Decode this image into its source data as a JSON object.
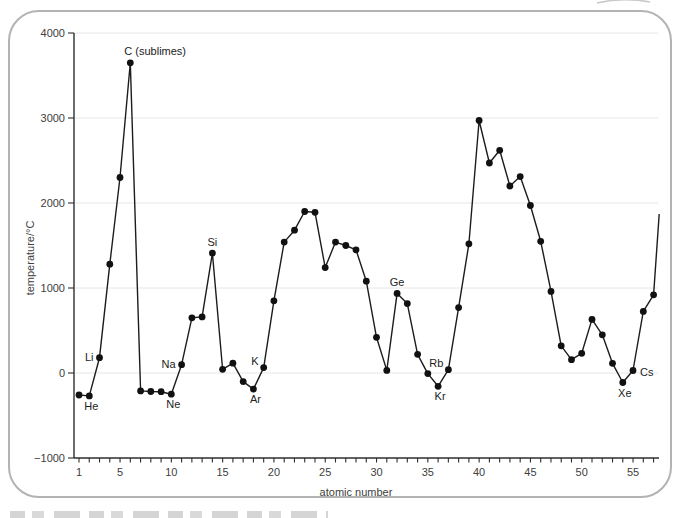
{
  "figure": {
    "panel_border_color": "#b3b3b3",
    "background_color": "#ffffff"
  },
  "chart_data": {
    "type": "line",
    "title": "",
    "xlabel": "atomic number",
    "ylabel": "temperature/°C",
    "xlim": [
      1,
      57.6
    ],
    "ylim": [
      -1000,
      4000
    ],
    "grid": "horizontal-light",
    "legend": "none",
    "marker": "filled-circle",
    "line_color": "#1c1c1c",
    "grid_color": "#e6e6e6",
    "y_ticks": [
      {
        "value": 4000,
        "label": "4000"
      },
      {
        "value": 3000,
        "label": "3000"
      },
      {
        "value": 2000,
        "label": "2000"
      },
      {
        "value": 1000,
        "label": "1000"
      },
      {
        "value": 0,
        "label": "0"
      },
      {
        "value": -1000,
        "label": "−1000"
      }
    ],
    "x_ticks_labeled": [
      1,
      5,
      10,
      15,
      20,
      25,
      30,
      35,
      40,
      45,
      50,
      55
    ],
    "x_minor_tick_step": 1,
    "x_minor_tick_range": [
      1,
      57
    ],
    "points": [
      {
        "z": 1,
        "element": "H",
        "value": -259
      },
      {
        "z": 2,
        "element": "He",
        "value": -270
      },
      {
        "z": 3,
        "element": "Li",
        "value": 180
      },
      {
        "z": 4,
        "element": "Be",
        "value": 1280
      },
      {
        "z": 5,
        "element": "B",
        "value": 2300
      },
      {
        "z": 6,
        "element": "C",
        "value": 3650
      },
      {
        "z": 7,
        "element": "N",
        "value": -210
      },
      {
        "z": 8,
        "element": "O",
        "value": -218
      },
      {
        "z": 9,
        "element": "F",
        "value": -220
      },
      {
        "z": 10,
        "element": "Ne",
        "value": -249
      },
      {
        "z": 11,
        "element": "Na",
        "value": 98
      },
      {
        "z": 12,
        "element": "Mg",
        "value": 650
      },
      {
        "z": 13,
        "element": "Al",
        "value": 660
      },
      {
        "z": 14,
        "element": "Si",
        "value": 1410
      },
      {
        "z": 15,
        "element": "P",
        "value": 44
      },
      {
        "z": 16,
        "element": "S",
        "value": 115
      },
      {
        "z": 17,
        "element": "Cl",
        "value": -101
      },
      {
        "z": 18,
        "element": "Ar",
        "value": -189
      },
      {
        "z": 19,
        "element": "K",
        "value": 63
      },
      {
        "z": 20,
        "element": "Ca",
        "value": 850
      },
      {
        "z": 21,
        "element": "Sc",
        "value": 1540
      },
      {
        "z": 22,
        "element": "Ti",
        "value": 1680
      },
      {
        "z": 23,
        "element": "V",
        "value": 1900
      },
      {
        "z": 24,
        "element": "Cr",
        "value": 1890
      },
      {
        "z": 25,
        "element": "Mn",
        "value": 1240
      },
      {
        "z": 26,
        "element": "Fe",
        "value": 1540
      },
      {
        "z": 27,
        "element": "Co",
        "value": 1500
      },
      {
        "z": 28,
        "element": "Ni",
        "value": 1450
      },
      {
        "z": 29,
        "element": "Cu",
        "value": 1080
      },
      {
        "z": 30,
        "element": "Zn",
        "value": 420
      },
      {
        "z": 31,
        "element": "Ga",
        "value": 30
      },
      {
        "z": 32,
        "element": "Ge",
        "value": 937
      },
      {
        "z": 33,
        "element": "As",
        "value": 817
      },
      {
        "z": 34,
        "element": "Se",
        "value": 220
      },
      {
        "z": 35,
        "element": "Br",
        "value": -7
      },
      {
        "z": 36,
        "element": "Kr",
        "value": -157
      },
      {
        "z": 37,
        "element": "Rb",
        "value": 39
      },
      {
        "z": 38,
        "element": "Sr",
        "value": 770
      },
      {
        "z": 39,
        "element": "Y",
        "value": 1520
      },
      {
        "z": 40,
        "element": "Zr",
        "value": 2970
      },
      {
        "z": 41,
        "element": "Nb",
        "value": 2470
      },
      {
        "z": 42,
        "element": "Mo",
        "value": 2620
      },
      {
        "z": 43,
        "element": "Tc",
        "value": 2200
      },
      {
        "z": 44,
        "element": "Ru",
        "value": 2310
      },
      {
        "z": 45,
        "element": "Rh",
        "value": 1970
      },
      {
        "z": 46,
        "element": "Pd",
        "value": 1550
      },
      {
        "z": 47,
        "element": "Ag",
        "value": 960
      },
      {
        "z": 48,
        "element": "Cd",
        "value": 320
      },
      {
        "z": 49,
        "element": "In",
        "value": 157
      },
      {
        "z": 50,
        "element": "Sn",
        "value": 232
      },
      {
        "z": 51,
        "element": "Sb",
        "value": 630
      },
      {
        "z": 52,
        "element": "Te",
        "value": 450
      },
      {
        "z": 53,
        "element": "I",
        "value": 114
      },
      {
        "z": 54,
        "element": "Xe",
        "value": -112
      },
      {
        "z": 55,
        "element": "Cs",
        "value": 29
      },
      {
        "z": 56,
        "element": "Ba",
        "value": 725
      },
      {
        "z": 57,
        "element": "La",
        "value": 920
      }
    ],
    "tail_segment": {
      "from_z": 57,
      "to_z": 57.55,
      "to_value": 1870
    },
    "annotations": [
      {
        "text": "He",
        "z": 2,
        "placement": "below"
      },
      {
        "text": "Li",
        "z": 3,
        "placement": "left"
      },
      {
        "text": "C (sublimes)",
        "z": 6,
        "placement": "above-start"
      },
      {
        "text": "Ne",
        "z": 10,
        "placement": "below"
      },
      {
        "text": "Na",
        "z": 11,
        "placement": "left"
      },
      {
        "text": "Si",
        "z": 14,
        "placement": "above"
      },
      {
        "text": "Ar",
        "z": 18,
        "placement": "below"
      },
      {
        "text": "K",
        "z": 19,
        "placement": "above-left"
      },
      {
        "text": "Ge",
        "z": 32,
        "placement": "above"
      },
      {
        "text": "Kr",
        "z": 36,
        "placement": "below"
      },
      {
        "text": "Rb",
        "z": 37,
        "placement": "above-left"
      },
      {
        "text": "Xe",
        "z": 54,
        "placement": "below"
      },
      {
        "text": "Cs",
        "z": 55,
        "placement": "right"
      }
    ]
  }
}
